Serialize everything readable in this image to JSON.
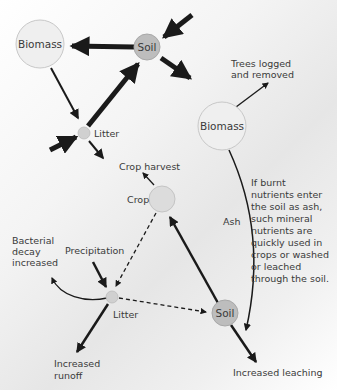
{
  "diagram": {
    "top_cycle": {
      "nodes": {
        "biomass": "Biomass",
        "soil": "Soil",
        "litter": "Litter"
      }
    },
    "bottom_cycle": {
      "nodes": {
        "biomass": "Biomass",
        "crop": "Crop",
        "litter": "Litter",
        "soil": "Soil"
      },
      "labels": {
        "trees_logged_line1": "Trees logged",
        "trees_logged_line2": "and removed",
        "crop_harvest": "Crop harvest",
        "ash": "Ash",
        "precipitation": "Precipitation",
        "bacterial_line1": "Bacterial",
        "bacterial_line2": "decay",
        "bacterial_line3": "increased",
        "runoff_line1": "Increased",
        "runoff_line2": "runoff",
        "leaching": "Increased leaching"
      },
      "annotation": [
        "If burnt",
        "nutrients enter",
        "the soil as ash,",
        "such mineral",
        "nutrients are",
        "quickly used in",
        "crops or washed",
        "or leached",
        "through the soil."
      ]
    },
    "colors": {
      "soil_fill": "#bdbdbd",
      "small_node_fill": "#d0d0d0",
      "biomass_fill": "#efefef",
      "arrow": "#1a1a1a"
    }
  }
}
